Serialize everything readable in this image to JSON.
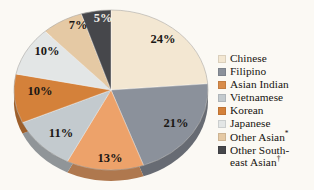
{
  "chart_data": {
    "type": "pie",
    "title": "",
    "subtitle": "",
    "xlabel": "",
    "ylabel": "",
    "legend_position": "right",
    "grid": false,
    "start_angle_deg": 0,
    "direction": "clockwise",
    "units": "percent",
    "categories": [
      "Chinese",
      "Filipino",
      "Asian Indian",
      "Vietnamese",
      "Korean",
      "Japanese",
      "Other Asian*",
      "Other Southeast Asian†"
    ],
    "values": [
      24,
      21,
      13,
      11,
      10,
      10,
      7,
      5
    ],
    "data_labels": [
      "24%",
      "21%",
      "13%",
      "11%",
      "10%",
      "10%",
      "7%",
      "5%"
    ],
    "colors": [
      "#f3e7d2",
      "#8b919b",
      "#eda濃",
      "#c3cace",
      "#d4813a",
      "#e3e6e6",
      "#e5c9a4",
      "#46474b"
    ],
    "slices": [
      {
        "label": "Chinese",
        "value": 24,
        "display": "24%",
        "color": "#f3e7d2",
        "label_color": "dark",
        "lx": 163,
        "ly": 43
      },
      {
        "label": "Filipino",
        "value": 21,
        "display": "21%",
        "color": "#8b919b",
        "label_color": "dark",
        "lx": 176,
        "ly": 127
      },
      {
        "label": "Asian Indian",
        "value": 13,
        "display": "13%",
        "color": "#eda26a",
        "label_color": "dark",
        "lx": 110,
        "ly": 162
      },
      {
        "label": "Vietnamese",
        "value": 11,
        "display": "11%",
        "color": "#c3cace",
        "label_color": "dark",
        "lx": 61,
        "ly": 137
      },
      {
        "label": "Korean",
        "value": 10,
        "display": "10%",
        "color": "#d4813a",
        "label_color": "dark",
        "lx": 40,
        "ly": 95
      },
      {
        "label": "Japanese",
        "value": 10,
        "display": "10%",
        "color": "#e3e6e6",
        "label_color": "dark",
        "lx": 47,
        "ly": 55
      },
      {
        "label": "Other Asian",
        "value": 7,
        "display": "7%",
        "color": "#e5c9a4",
        "label_color": "dark",
        "lx": 78,
        "ly": 29
      },
      {
        "label": "Other Southeast Asian",
        "value": 5,
        "display": "5%",
        "color": "#46474b",
        "label_color": "light",
        "lx": 103,
        "ly": 22
      }
    ],
    "background_color": "#fbf9f4"
  },
  "legend": {
    "items": [
      {
        "label": "Chinese",
        "swatch": "#f3e7d2",
        "footnote": ""
      },
      {
        "label": "Filipino",
        "swatch": "#8b919b",
        "footnote": ""
      },
      {
        "label": "Asian Indian",
        "swatch": "#d98c4a",
        "footnote": ""
      },
      {
        "label": "Vietnamese",
        "swatch": "#c3cace",
        "footnote": ""
      },
      {
        "label": "Korean",
        "swatch": "#d4813a",
        "footnote": ""
      },
      {
        "label": "Japanese",
        "swatch": "#e3e6e6",
        "footnote": ""
      },
      {
        "label": "Other Asian",
        "swatch": "#e5c9a4",
        "footnote": "*"
      },
      {
        "label": "Other South-\neast Asian",
        "swatch": "#46474b",
        "footnote": "†"
      }
    ]
  }
}
